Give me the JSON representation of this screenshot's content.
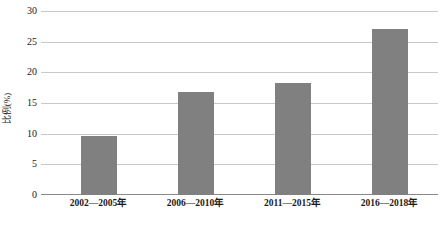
{
  "chart_data": {
    "type": "bar",
    "title": "",
    "subtitle": "",
    "xlabel": "",
    "ylabel": "比例(%)",
    "categories": [
      "2002—2005年",
      "2006—2010年",
      "2011—2015年",
      "2016—2018年"
    ],
    "values": [
      9.7,
      16.8,
      18.3,
      27.1
    ],
    "series": [
      {
        "name": "比例",
        "values": [
          9.7,
          16.8,
          18.3,
          27.1
        ]
      }
    ],
    "ylim": [
      0,
      30
    ],
    "ytick_step": 5,
    "ytick_labels": [
      "0",
      "5",
      "10",
      "15",
      "20",
      "25",
      "30"
    ],
    "ytick_values": [
      0,
      5,
      10,
      15,
      20,
      25,
      30
    ],
    "grid": "horizontal",
    "legend": "none",
    "bar_color": "#808080",
    "gridline_color": "#c8c8c8",
    "axis_color": "#8a8a8a",
    "text_color": "#1a1a1a",
    "background": "#ffffff"
  }
}
